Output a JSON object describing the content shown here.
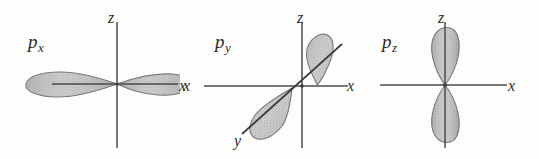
{
  "figure": {
    "background_color": "#fdfdfc",
    "axis_color": "#444444",
    "lobe_fill_color": "#b9b9b9",
    "lobe_edge_color": "#6e6e6e",
    "text_color": "#2a2a2a"
  },
  "panels": [
    {
      "id": "px",
      "orbital_base": "p",
      "orbital_sub": "x",
      "lobe_orientation": "horizontal",
      "lobe_count": 2,
      "axes": [
        {
          "name": "z",
          "label": "z",
          "direction": "vertical"
        },
        {
          "name": "x",
          "label": "x",
          "direction": "horizontal"
        }
      ]
    },
    {
      "id": "py",
      "orbital_base": "p",
      "orbital_sub": "y",
      "lobe_orientation": "diagonal",
      "lobe_count": 2,
      "axes": [
        {
          "name": "z",
          "label": "z",
          "direction": "vertical"
        },
        {
          "name": "x-left",
          "label": "x",
          "direction": "horizontal"
        },
        {
          "name": "x-right",
          "label": "x",
          "direction": "horizontal"
        },
        {
          "name": "y",
          "label": "y",
          "direction": "diagonal"
        }
      ]
    },
    {
      "id": "pz",
      "orbital_base": "p",
      "orbital_sub": "z",
      "lobe_orientation": "vertical",
      "lobe_count": 2,
      "axes": [
        {
          "name": "z",
          "label": "z",
          "direction": "vertical"
        },
        {
          "name": "x",
          "label": "x",
          "direction": "horizontal"
        }
      ]
    }
  ]
}
